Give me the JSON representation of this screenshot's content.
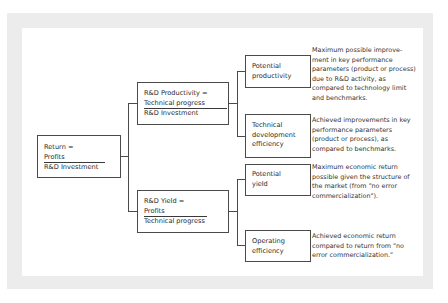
{
  "diagram": {
    "root": {
      "title": "Return =",
      "numerator": "Profits",
      "denominator": "R&D Investment"
    },
    "branches": [
      {
        "title": "R&D Productivity =",
        "numerator": "Technical progress",
        "denominator": "R&D Investment",
        "children": [
          {
            "label_lines": [
              "Potential",
              "productivity"
            ],
            "description_lines": [
              "Maximum possible improve-",
              "ment in key performance",
              "parameters (product or process)",
              "due to R&D activity, as",
              "compared to technology limit",
              "and benchmarks."
            ]
          },
          {
            "label_lines": [
              "Technical",
              "development",
              "efficiency"
            ],
            "description_lines": [
              "Achieved improvements in key",
              "performance parameters",
              "(product or process), as",
              "compared to benchmarks."
            ]
          }
        ]
      },
      {
        "title": "R&D Yield =",
        "numerator": "Profits",
        "denominator": "Technical progress",
        "children": [
          {
            "label_lines": [
              "Potential",
              "yield"
            ],
            "description_lines": [
              "Maximum economic return",
              "possible given the structure of",
              "the market (from \"no error",
              "commercialization\")."
            ]
          },
          {
            "label_lines": [
              "Operating",
              "efficiency"
            ],
            "description_lines": [
              "Achieved economic return",
              "compared to return from \"no",
              "error commercialization.\""
            ]
          }
        ]
      }
    ],
    "colors": {
      "frame": "#ececec",
      "panel": "#ffffff",
      "lines": "#4a4a4a",
      "text": "#2a2a2a"
    }
  }
}
